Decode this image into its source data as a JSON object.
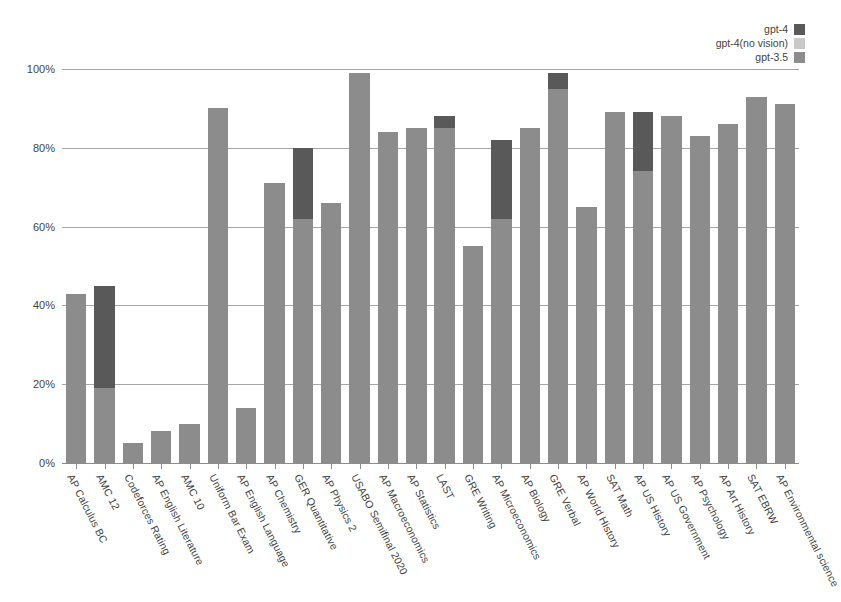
{
  "legend": {
    "position": "top-right",
    "items": [
      {
        "label": "gpt-4",
        "color": "#595959",
        "name": "gpt-4"
      },
      {
        "label": "gpt-4(no vision)",
        "color": "#c9c9c9",
        "name": "gpt-4-no-vision"
      },
      {
        "label": "gpt-3.5",
        "color": "#8c8c8c",
        "name": "gpt-3.5"
      }
    ]
  },
  "axis": {
    "y_ticks": [
      "0%",
      "20%",
      "40%",
      "60%",
      "80%",
      "100%"
    ],
    "y_tick_values": [
      0,
      20,
      40,
      60,
      80,
      100
    ],
    "ylim": [
      0,
      100
    ]
  },
  "chart_data": {
    "type": "bar",
    "title": "",
    "subtitle": "",
    "xlabel": "",
    "ylabel": "",
    "ylim": [
      0,
      100
    ],
    "grid": true,
    "stacked_overlay": true,
    "legend_position": "top-right",
    "colors": {
      "gpt-4": "#595959",
      "gpt-4(no vision)": "#c9c9c9",
      "gpt-3.5": "#8c8c8c"
    },
    "categories": [
      "AP Calculus BC",
      "AMC 12",
      "Codeforces Rating",
      "AP English Literature",
      "AMC 10",
      "Uniform Bar Exam",
      "AP English Language",
      "AP Chemistry",
      "GER Quantitative",
      "AP Physics 2",
      "USABO Semifinal 2020",
      "AP Macroeconomics",
      "AP Statistics",
      "LAST",
      "GRE Writing",
      "AP Microeconomics",
      "AP Biology",
      "GRE Verbal",
      "AP World History",
      "SAT Math",
      "AP US History",
      "AP US Government",
      "AP Psychology",
      "AP Art History",
      "SAT EBRW",
      "AP Environmental science"
    ],
    "series": [
      {
        "name": "gpt-3.5",
        "values": [
          43,
          19,
          5,
          8,
          10,
          90,
          14,
          71,
          62,
          66,
          99,
          84,
          85,
          85,
          55,
          62,
          85,
          95,
          65,
          89,
          74,
          88,
          83,
          86,
          93,
          91
        ]
      },
      {
        "name": "gpt-4",
        "values": [
          43,
          45,
          5,
          8,
          10,
          90,
          14,
          71,
          80,
          66,
          99,
          84,
          85,
          88,
          55,
          82,
          85,
          99,
          65,
          89,
          89,
          88,
          83,
          86,
          93,
          91
        ]
      },
      {
        "name": "gpt-4(no vision)",
        "values": [
          43,
          45,
          5,
          8,
          10,
          90,
          14,
          71,
          80,
          66,
          99,
          84,
          85,
          88,
          55,
          82,
          85,
          99,
          65,
          89,
          89,
          88,
          83,
          86,
          93,
          91
        ]
      }
    ],
    "bars": [
      {
        "category": "AP Calculus BC",
        "gpt35": 43,
        "gpt4": 43
      },
      {
        "category": "AMC 12",
        "gpt35": 19,
        "gpt4": 45
      },
      {
        "category": "Codeforces Rating",
        "gpt35": 5,
        "gpt4": 5
      },
      {
        "category": "AP English Literature",
        "gpt35": 8,
        "gpt4": 8
      },
      {
        "category": "AMC 10",
        "gpt35": 10,
        "gpt4": 10
      },
      {
        "category": "Uniform Bar Exam",
        "gpt35": 90,
        "gpt4": 90
      },
      {
        "category": "AP English Language",
        "gpt35": 14,
        "gpt4": 14
      },
      {
        "category": "AP Chemistry",
        "gpt35": 71,
        "gpt4": 71
      },
      {
        "category": "GER Quantitative",
        "gpt35": 62,
        "gpt4": 80
      },
      {
        "category": "AP Physics 2",
        "gpt35": 66,
        "gpt4": 66
      },
      {
        "category": "USABO Semifinal 2020",
        "gpt35": 99,
        "gpt4": 99
      },
      {
        "category": "AP Macroeconomics",
        "gpt35": 84,
        "gpt4": 84
      },
      {
        "category": "AP Statistics",
        "gpt35": 85,
        "gpt4": 85
      },
      {
        "category": "LAST",
        "gpt35": 85,
        "gpt4": 88
      },
      {
        "category": "GRE Writing",
        "gpt35": 55,
        "gpt4": 55
      },
      {
        "category": "AP Microeconomics",
        "gpt35": 62,
        "gpt4": 82
      },
      {
        "category": "AP Biology",
        "gpt35": 85,
        "gpt4": 85
      },
      {
        "category": "GRE Verbal",
        "gpt35": 95,
        "gpt4": 99
      },
      {
        "category": "AP World History",
        "gpt35": 65,
        "gpt4": 65
      },
      {
        "category": "SAT Math",
        "gpt35": 89,
        "gpt4": 89
      },
      {
        "category": "AP US History",
        "gpt35": 74,
        "gpt4": 89
      },
      {
        "category": "AP US Government",
        "gpt35": 88,
        "gpt4": 88
      },
      {
        "category": "AP Psychology",
        "gpt35": 83,
        "gpt4": 83
      },
      {
        "category": "AP Art History",
        "gpt35": 86,
        "gpt4": 86
      },
      {
        "category": "SAT EBRW",
        "gpt35": 93,
        "gpt4": 93
      },
      {
        "category": "AP Environmental science",
        "gpt35": 91,
        "gpt4": 91
      }
    ]
  }
}
